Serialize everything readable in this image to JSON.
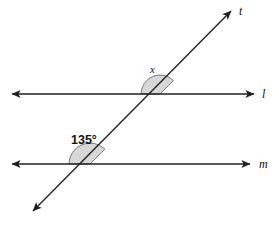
{
  "figure": {
    "background_color": "#ffffff",
    "stroke_color": "#231f20",
    "arc_fill_color": "#d8d8d8",
    "arc_stroke_color": "#58595b",
    "text_color": "#111111"
  },
  "lines": [
    {
      "name": "l",
      "label": "l",
      "kind": "parallel-line",
      "orientation": "horizontal",
      "y": 94,
      "x_start": 12,
      "x_end": 254,
      "arrow_start": true,
      "arrow_end": true
    },
    {
      "name": "m",
      "label": "m",
      "kind": "parallel-line",
      "orientation": "horizontal",
      "y": 164,
      "x_start": 12,
      "x_end": 250,
      "arrow_start": true,
      "arrow_end": true
    },
    {
      "name": "t",
      "label": "t",
      "kind": "transversal",
      "orientation": "diagonal",
      "x_start": 33,
      "y_start": 211,
      "x_end": 231,
      "y_end": 11,
      "arrow_start": true,
      "arrow_end": true
    }
  ],
  "intersections": [
    {
      "name": "l-and-t",
      "x": 160,
      "y": 94
    },
    {
      "name": "m-and-t",
      "x": 90,
      "y": 164
    }
  ],
  "angles": [
    {
      "name": "angle-x",
      "label": "x",
      "label_type": "variable",
      "at_intersection": "l-and-t",
      "arc_radius": 19,
      "start_deg": 180,
      "end_deg": 45,
      "label_x": 150,
      "label_y": 64
    },
    {
      "name": "angle-135",
      "label": "135°",
      "label_type": "measure",
      "value": 135,
      "unit": "degrees",
      "at_intersection": "m-and-t",
      "arc_radius": 21,
      "start_deg": 180,
      "end_deg": 45,
      "label_x": 71,
      "label_y": 134
    }
  ]
}
